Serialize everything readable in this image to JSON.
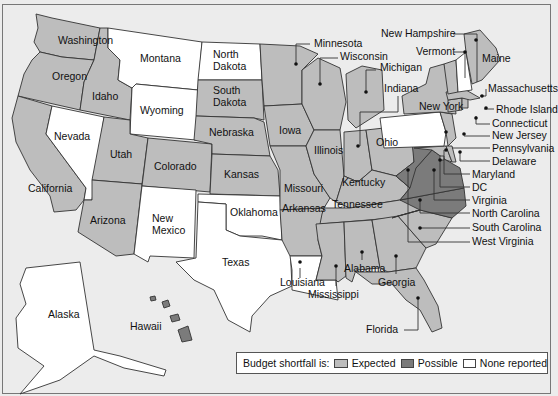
{
  "map": {
    "subject": "US states budget shortfall",
    "colors": {
      "expected": "#bdbdbd",
      "possible": "#7b7b7b",
      "none_reported": "#ffffff",
      "background": "#ececec"
    },
    "states": [
      {
        "name": "Washington",
        "status": "expected"
      },
      {
        "name": "Oregon",
        "status": "expected"
      },
      {
        "name": "California",
        "status": "expected"
      },
      {
        "name": "Idaho",
        "status": "expected"
      },
      {
        "name": "Nevada",
        "status": "none_reported"
      },
      {
        "name": "Montana",
        "status": "none_reported"
      },
      {
        "name": "Wyoming",
        "status": "none_reported"
      },
      {
        "name": "Utah",
        "status": "expected"
      },
      {
        "name": "Arizona",
        "status": "expected"
      },
      {
        "name": "Colorado",
        "status": "expected"
      },
      {
        "name": "New Mexico",
        "status": "none_reported"
      },
      {
        "name": "North Dakota",
        "status": "none_reported"
      },
      {
        "name": "South Dakota",
        "status": "expected"
      },
      {
        "name": "Nebraska",
        "status": "expected"
      },
      {
        "name": "Kansas",
        "status": "expected"
      },
      {
        "name": "Oklahoma",
        "status": "none_reported"
      },
      {
        "name": "Texas",
        "status": "none_reported"
      },
      {
        "name": "Minnesota",
        "status": "expected"
      },
      {
        "name": "Iowa",
        "status": "expected"
      },
      {
        "name": "Missouri",
        "status": "expected"
      },
      {
        "name": "Arkansas",
        "status": "expected"
      },
      {
        "name": "Louisiana",
        "status": "none_reported"
      },
      {
        "name": "Wisconsin",
        "status": "expected"
      },
      {
        "name": "Illinois",
        "status": "expected"
      },
      {
        "name": "Michigan",
        "status": "expected"
      },
      {
        "name": "Indiana",
        "status": "expected"
      },
      {
        "name": "Ohio",
        "status": "expected"
      },
      {
        "name": "Kentucky",
        "status": "expected"
      },
      {
        "name": "Tennessee",
        "status": "expected"
      },
      {
        "name": "Mississippi",
        "status": "expected"
      },
      {
        "name": "Alabama",
        "status": "expected"
      },
      {
        "name": "Georgia",
        "status": "expected"
      },
      {
        "name": "Florida",
        "status": "expected"
      },
      {
        "name": "South Carolina",
        "status": "expected"
      },
      {
        "name": "North Carolina",
        "status": "possible"
      },
      {
        "name": "Virginia",
        "status": "possible"
      },
      {
        "name": "West Virginia",
        "status": "possible"
      },
      {
        "name": "Maryland",
        "status": "expected"
      },
      {
        "name": "DC",
        "status": "expected"
      },
      {
        "name": "Delaware",
        "status": "expected"
      },
      {
        "name": "Pennsylvania",
        "status": "none_reported"
      },
      {
        "name": "New Jersey",
        "status": "expected"
      },
      {
        "name": "New York",
        "status": "expected"
      },
      {
        "name": "Connecticut",
        "status": "expected"
      },
      {
        "name": "Rhode Island",
        "status": "expected"
      },
      {
        "name": "Massachusetts",
        "status": "expected"
      },
      {
        "name": "Vermont",
        "status": "expected"
      },
      {
        "name": "New Hampshire",
        "status": "none_reported"
      },
      {
        "name": "Maine",
        "status": "expected"
      },
      {
        "name": "Alaska",
        "status": "none_reported"
      },
      {
        "name": "Hawaii",
        "status": "possible"
      }
    ]
  },
  "legend": {
    "title": "Budget shortfall is:",
    "items": [
      {
        "label": "Expected",
        "key": "expected"
      },
      {
        "label": "Possible",
        "key": "possible"
      },
      {
        "label": "None reported",
        "key": "none_reported"
      }
    ]
  }
}
